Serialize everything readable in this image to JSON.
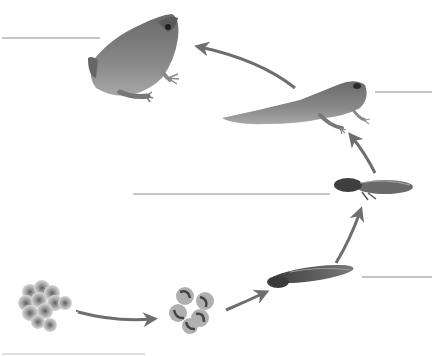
{
  "diagram": {
    "type": "life-cycle",
    "stages": [
      {
        "id": "eggs",
        "label": "",
        "label_line": "bottom-left"
      },
      {
        "id": "embryos",
        "label": ""
      },
      {
        "id": "tadpole",
        "label": "",
        "label_line": "right-lower"
      },
      {
        "id": "tadpole-with-legs",
        "label": "",
        "label_line": "middle-left"
      },
      {
        "id": "froglet",
        "label": "",
        "label_line": "right-upper"
      },
      {
        "id": "adult-frog",
        "label": "",
        "label_line": "top-left"
      }
    ],
    "arrows": [
      {
        "from": "eggs",
        "to": "embryos"
      },
      {
        "from": "embryos",
        "to": "tadpole"
      },
      {
        "from": "tadpole",
        "to": "tadpole-with-legs"
      },
      {
        "from": "tadpole-with-legs",
        "to": "froglet"
      },
      {
        "from": "froglet",
        "to": "adult-frog"
      }
    ],
    "colors": {
      "background": "#ffffff",
      "arrow": "#6e6e6e",
      "label_line": "#8a8a8a",
      "frog_body": "#7a7a7a",
      "frog_dark": "#4e4e4e",
      "frog_light": "#b5b5b5"
    }
  }
}
